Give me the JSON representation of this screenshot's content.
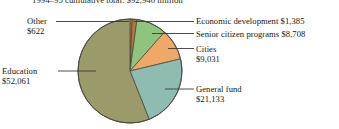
{
  "figure": {
    "title": "1994–95 cumulative total: $92,940 million",
    "background_color": "#ffffff"
  },
  "callouts": {
    "other": {
      "name": "Other",
      "value": "$622"
    },
    "education": {
      "name": "Education",
      "value": "$52,061"
    },
    "economic_development": {
      "text": "Economic development $1,385"
    },
    "senior_citizen_programs": {
      "text": "Senior citizen programs $8,708"
    },
    "cities": {
      "name": "Cities",
      "value": "$9,031"
    },
    "general_fund": {
      "name": "General fund",
      "value": "$21,133"
    }
  },
  "chart_data": {
    "type": "pie",
    "title": "1994–95 cumulative total: $92,940 million",
    "unit": "millions of dollars",
    "total": 92940,
    "legend_position": "callout-labels",
    "grid": false,
    "categories": [
      "Other",
      "Economic development",
      "Senior citizen programs",
      "Cities",
      "General fund",
      "Education"
    ],
    "values": [
      622,
      1385,
      8708,
      9031,
      21133,
      52061
    ],
    "value_labels": [
      "$622",
      "$1,385",
      "$8,708",
      "$9,031",
      "$21,133",
      "$52,061"
    ],
    "percentages": [
      0.7,
      1.5,
      9.4,
      9.7,
      22.7,
      56.0
    ],
    "colors": [
      "#c98a4b",
      "#b8763f",
      "#8fc47e",
      "#f0a868",
      "#8fbcb0",
      "#9a9a6b"
    ],
    "start_angle_deg": -90,
    "direction": "clockwise",
    "center": [
      130,
      71
    ],
    "radius": 52,
    "stroke_color": "#4a4a42"
  },
  "colors": {
    "other": "#c98a4b",
    "economic_development": "#b8763f",
    "senior_citizen_programs": "#8fc47e",
    "cities": "#f0a868",
    "general_fund": "#8fbcb0",
    "education": "#9a9a6b",
    "leader_line": "#3a3a3a",
    "slice_outline": "#4a4a42"
  }
}
